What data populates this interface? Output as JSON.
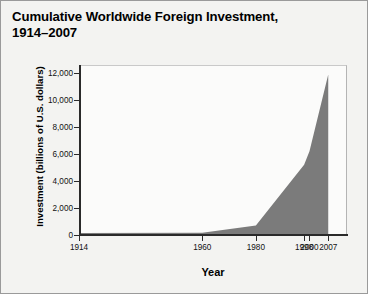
{
  "title": {
    "line1": "Cumulative Worldwide Foreign Investment,",
    "line2": "1914–2007"
  },
  "chart_data": {
    "type": "area",
    "title": "Cumulative Worldwide Foreign Investment, 1914–2007",
    "xlabel": "Year",
    "ylabel": "Investment (billions of U.S. dollars)",
    "x": [
      1914,
      1960,
      1980,
      1998,
      2000,
      2007
    ],
    "values": [
      143,
      160,
      700,
      5200,
      6200,
      11900
    ],
    "xlim": [
      1914,
      2014
    ],
    "ylim": [
      0,
      12600
    ],
    "xticks": [
      1914,
      1960,
      1980,
      1998,
      2000,
      2007
    ],
    "xticklabels": [
      "1914",
      "1960",
      "1980",
      "1998",
      "2000",
      "2007"
    ],
    "yticks": [
      0,
      2000,
      4000,
      6000,
      8000,
      10000,
      12000
    ],
    "yticklabels": [
      "0",
      "2,000",
      "4,000",
      "6,000",
      "8,000",
      "10,000",
      "12,000"
    ],
    "grid": false,
    "legend": false,
    "series_color": "#7b7b7b",
    "axis_color": "#2a2a2a",
    "plot_background": "#fbfbfa",
    "figure_background": "#f3f3f1"
  }
}
